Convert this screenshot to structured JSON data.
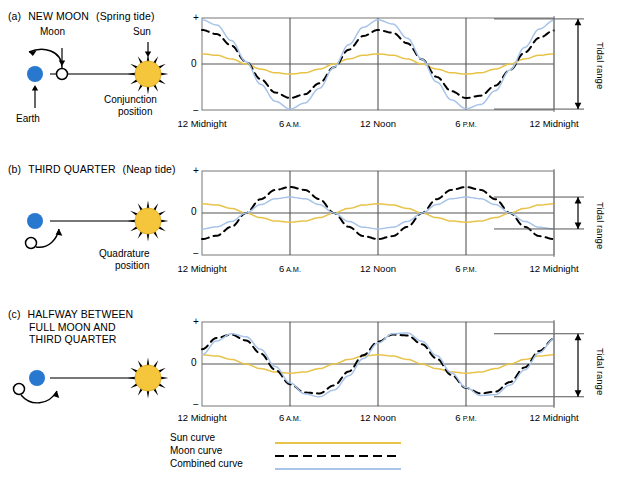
{
  "figure": {
    "title_visible": false,
    "colors": {
      "sun_curve": "#e8c34a",
      "moon_curve": "#000000",
      "combined_curve": "#a8c4e8",
      "earth": "#2878d0",
      "sun_body": "#f5c63c",
      "axis": "#555555",
      "frame": "#666666"
    }
  },
  "panels": [
    {
      "id": "a",
      "letter": "(a)",
      "title": "NEW MOON",
      "subtitle": "(Spring tide)",
      "diagram": {
        "moon_label": "Moon",
        "sun_label": "Sun",
        "earth_label": "Earth",
        "position_label_line1": "Conjunction",
        "position_label_line2": "position",
        "moon_position": "between-earth-and-sun"
      },
      "tidal_range_label_line1": "Tidal",
      "tidal_range_label_line2": "range",
      "tidal_range_top": 0.98,
      "tidal_range_bottom": -0.98
    },
    {
      "id": "b",
      "letter": "(b)",
      "title": "THIRD QUARTER",
      "subtitle": "(Neap tide)",
      "diagram": {
        "moon_label": "",
        "sun_label": "",
        "earth_label": "",
        "position_label_line1": "Quadrature",
        "position_label_line2": "position",
        "moon_position": "below-earth"
      },
      "tidal_range_label_line1": "Tidal",
      "tidal_range_label_line2": "range",
      "tidal_range_top": 0.38,
      "tidal_range_bottom": -0.38
    },
    {
      "id": "c",
      "letter": "(c)",
      "title_line1": "HALFWAY BETWEEN",
      "title_line2": "FULL MOON AND",
      "title_line3": "THIRD QUARTER",
      "subtitle": "",
      "diagram": {
        "moon_label": "",
        "sun_label": "",
        "earth_label": "",
        "position_label_line1": "",
        "position_label_line2": "",
        "moon_position": "left-of-earth"
      },
      "tidal_range_label_line1": "Tidal",
      "tidal_range_label_line2": "range",
      "tidal_range_top": 0.72,
      "tidal_range_bottom": -0.78
    }
  ],
  "axis": {
    "y_plus": "+",
    "y_zero": "0",
    "y_minus": "−",
    "x_ticks": [
      {
        "main": "12",
        "unit": "Midnight",
        "unit_small": false
      },
      {
        "main": "6",
        "unit": "A.M.",
        "unit_small": true
      },
      {
        "main": "12",
        "unit": "Noon",
        "unit_small": false
      },
      {
        "main": "6",
        "unit": "P.M.",
        "unit_small": true
      },
      {
        "main": "12",
        "unit": "Midnight",
        "unit_small": false
      }
    ]
  },
  "legend": {
    "items": [
      {
        "label": "Sun curve",
        "style": "solid",
        "color": "#e8c34a"
      },
      {
        "label": "Moon  curve",
        "style": "dashed",
        "color": "#000000"
      },
      {
        "label": "Combined curve",
        "style": "solid",
        "color": "#a8c4e8"
      }
    ]
  },
  "chart_data": {
    "type": "line",
    "xlabel": "",
    "ylabel": "",
    "xlim": [
      0,
      24
    ],
    "ylim": [
      -1.05,
      1.05
    ],
    "x_tick_values": [
      0,
      6,
      12,
      18,
      24
    ],
    "x_tick_labels": [
      "12 Midnight",
      "6 A.M.",
      "12 Noon",
      "6 P.M.",
      "12 Midnight"
    ],
    "y_tick_values": [
      1,
      0,
      -1
    ],
    "y_tick_labels": [
      "+",
      "0",
      "−"
    ],
    "grid": true,
    "legend_position": "bottom",
    "panels": [
      {
        "id": "a",
        "name": "NEW MOON (Spring tide)",
        "series": [
          {
            "name": "Sun curve",
            "color": "#e8c34a",
            "style": "solid",
            "amplitude": 0.22,
            "period_hours": 12.0,
            "phase_deg": 0,
            "offset": 0,
            "x": [
              0,
              1,
              2,
              3,
              4,
              5,
              6,
              7,
              8,
              9,
              10,
              11,
              12,
              13,
              14,
              15,
              16,
              17,
              18,
              19,
              20,
              21,
              22,
              23,
              24
            ],
            "y": [
              0.22,
              0.19,
              0.11,
              0.0,
              -0.11,
              -0.19,
              -0.22,
              -0.19,
              -0.11,
              0.0,
              0.11,
              0.19,
              0.22,
              0.19,
              0.11,
              0.0,
              -0.11,
              -0.19,
              -0.22,
              -0.19,
              -0.11,
              0.0,
              0.11,
              0.19,
              0.22
            ]
          },
          {
            "name": "Moon curve",
            "color": "#000000",
            "style": "dashed",
            "amplitude": 0.74,
            "period_hours": 12.4,
            "phase_deg": 0,
            "offset": 0,
            "x": [
              0,
              1,
              2,
              3,
              4,
              5,
              6,
              7,
              8,
              9,
              10,
              11,
              12,
              13,
              14,
              15,
              16,
              17,
              18,
              19,
              20,
              21,
              22,
              23,
              24
            ],
            "y": [
              0.74,
              0.65,
              0.4,
              0.05,
              -0.33,
              -0.62,
              -0.74,
              -0.66,
              -0.42,
              -0.07,
              0.31,
              0.61,
              0.74,
              0.68,
              0.45,
              0.1,
              -0.28,
              -0.59,
              -0.74,
              -0.69,
              -0.47,
              -0.13,
              0.25,
              0.57,
              0.73
            ]
          },
          {
            "name": "Combined curve",
            "color": "#a8c4e8",
            "style": "solid",
            "amplitude": 0.98,
            "period_hours": 12.2,
            "phase_deg": 0,
            "offset": 0,
            "x": [
              0,
              1,
              2,
              3,
              4,
              5,
              6,
              7,
              8,
              9,
              10,
              11,
              12,
              13,
              14,
              15,
              16,
              17,
              18,
              19,
              20,
              21,
              22,
              23,
              24
            ],
            "y": [
              0.96,
              0.85,
              0.51,
              0.05,
              -0.44,
              -0.81,
              -0.98,
              -0.85,
              -0.53,
              -0.07,
              0.42,
              0.8,
              0.96,
              0.87,
              0.56,
              0.1,
              -0.39,
              -0.78,
              -0.97,
              -0.88,
              -0.58,
              -0.13,
              0.36,
              0.76,
              0.95
            ]
          }
        ]
      },
      {
        "id": "b",
        "name": "THIRD QUARTER (Neap tide)",
        "series": [
          {
            "name": "Sun curve",
            "color": "#e8c34a",
            "style": "solid",
            "amplitude": 0.22,
            "period_hours": 12.0,
            "phase_deg": 180,
            "offset": 0,
            "x": [
              0,
              1,
              2,
              3,
              4,
              5,
              6,
              7,
              8,
              9,
              10,
              11,
              12,
              13,
              14,
              15,
              16,
              17,
              18,
              19,
              20,
              21,
              22,
              23,
              24
            ],
            "y": [
              0.22,
              0.19,
              0.11,
              0.0,
              -0.11,
              -0.19,
              -0.22,
              -0.19,
              -0.11,
              0.0,
              0.11,
              0.19,
              0.22,
              0.19,
              0.11,
              0.0,
              -0.11,
              -0.19,
              -0.22,
              -0.19,
              -0.11,
              0.0,
              0.11,
              0.19,
              0.22
            ]
          },
          {
            "name": "Moon curve",
            "color": "#000000",
            "style": "dashed",
            "amplitude": 0.62,
            "period_hours": 12.4,
            "phase_deg": 180,
            "offset": 0,
            "x": [
              0,
              1,
              2,
              3,
              4,
              5,
              6,
              7,
              8,
              9,
              10,
              11,
              12,
              13,
              14,
              15,
              16,
              17,
              18,
              19,
              20,
              21,
              22,
              23,
              24
            ],
            "y": [
              -0.62,
              -0.54,
              -0.33,
              0.0,
              0.33,
              0.55,
              0.62,
              0.55,
              0.33,
              0.0,
              -0.33,
              -0.55,
              -0.62,
              -0.55,
              -0.33,
              0.0,
              0.33,
              0.55,
              0.62,
              0.55,
              0.33,
              0.0,
              -0.33,
              -0.55,
              -0.62
            ]
          },
          {
            "name": "Combined curve",
            "color": "#a8c4e8",
            "style": "solid",
            "amplitude": 0.38,
            "period_hours": 12.2,
            "phase_deg": 180,
            "offset": 0,
            "x": [
              0,
              1,
              2,
              3,
              4,
              5,
              6,
              7,
              8,
              9,
              10,
              11,
              12,
              13,
              14,
              15,
              16,
              17,
              18,
              19,
              20,
              21,
              22,
              23,
              24
            ],
            "y": [
              -0.38,
              -0.33,
              -0.2,
              0.0,
              0.2,
              0.34,
              0.38,
              0.34,
              0.2,
              0.0,
              -0.2,
              -0.34,
              -0.38,
              -0.34,
              -0.2,
              0.0,
              0.2,
              0.34,
              0.38,
              0.34,
              0.2,
              0.0,
              -0.2,
              -0.34,
              -0.38
            ]
          }
        ]
      },
      {
        "id": "c",
        "name": "HALFWAY BETWEEN FULL MOON AND THIRD QUARTER",
        "series": [
          {
            "name": "Sun curve",
            "color": "#e8c34a",
            "style": "solid",
            "amplitude": 0.22,
            "period_hours": 12.0,
            "phase_deg": 0,
            "offset": 0,
            "x": [
              0,
              1,
              2,
              3,
              4,
              5,
              6,
              7,
              8,
              9,
              10,
              11,
              12,
              13,
              14,
              15,
              16,
              17,
              18,
              19,
              20,
              21,
              22,
              23,
              24
            ],
            "y": [
              0.22,
              0.19,
              0.11,
              0.0,
              -0.11,
              -0.19,
              -0.22,
              -0.19,
              -0.11,
              0.0,
              0.11,
              0.19,
              0.22,
              0.19,
              0.11,
              0.0,
              -0.11,
              -0.19,
              -0.22,
              -0.19,
              -0.11,
              0.0,
              0.11,
              0.19,
              0.22
            ]
          },
          {
            "name": "Moon curve",
            "color": "#000000",
            "style": "dashed",
            "amplitude": 0.7,
            "period_hours": 12.4,
            "phase_deg": -60,
            "offset": 0,
            "x": [
              0,
              1,
              2,
              3,
              4,
              5,
              6,
              7,
              8,
              9,
              10,
              11,
              12,
              13,
              14,
              15,
              16,
              17,
              18,
              19,
              20,
              21,
              22,
              23,
              24
            ],
            "y": [
              0.35,
              0.62,
              0.7,
              0.56,
              0.25,
              -0.14,
              -0.48,
              -0.68,
              -0.7,
              -0.51,
              -0.18,
              0.21,
              0.53,
              0.7,
              0.68,
              0.47,
              0.13,
              -0.26,
              -0.57,
              -0.7,
              -0.66,
              -0.43,
              -0.08,
              0.31,
              0.6
            ]
          },
          {
            "name": "Combined curve",
            "color": "#a8c4e8",
            "style": "solid",
            "amplitude": 0.75,
            "period_hours": 12.2,
            "phase_deg": -48,
            "offset": 0,
            "x": [
              0,
              1,
              2,
              3,
              4,
              5,
              6,
              7,
              8,
              9,
              10,
              11,
              12,
              13,
              14,
              15,
              16,
              17,
              18,
              19,
              20,
              21,
              22,
              23,
              24
            ],
            "y": [
              0.22,
              0.55,
              0.72,
              0.65,
              0.35,
              -0.06,
              -0.45,
              -0.71,
              -0.78,
              -0.62,
              -0.28,
              0.13,
              0.5,
              0.72,
              0.74,
              0.54,
              0.2,
              -0.21,
              -0.56,
              -0.75,
              -0.73,
              -0.5,
              -0.14,
              0.27,
              0.6
            ]
          }
        ]
      }
    ]
  }
}
